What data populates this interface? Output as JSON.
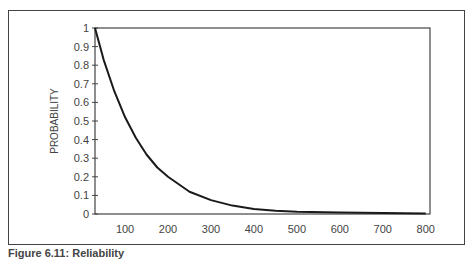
{
  "caption": "Figure 6.11: Reliability",
  "chart_data": {
    "type": "line",
    "title": "",
    "xlabel": "",
    "ylabel": "PROBABILITY",
    "xlim": [
      30,
      810
    ],
    "ylim": [
      0,
      1
    ],
    "x_ticks": [
      100,
      200,
      300,
      400,
      500,
      600,
      700,
      800
    ],
    "y_ticks": [
      0,
      0.1,
      0.2,
      0.3,
      0.4,
      0.5,
      0.6,
      0.7,
      0.8,
      0.9,
      1
    ],
    "y_tick_labels": [
      "0",
      "0.1",
      "0.2",
      "0.3",
      "0.4",
      "0.5",
      "0.6",
      "0.7",
      "0.8",
      "0.9",
      "1"
    ],
    "grid": false,
    "legend": null,
    "series": [
      {
        "name": "Reliability",
        "x": [
          30,
          50,
          75,
          100,
          125,
          150,
          175,
          200,
          250,
          300,
          350,
          400,
          450,
          500,
          600,
          700,
          800
        ],
        "values": [
          1.0,
          0.83,
          0.66,
          0.52,
          0.41,
          0.32,
          0.25,
          0.2,
          0.12,
          0.075,
          0.045,
          0.027,
          0.017,
          0.012,
          0.008,
          0.005,
          0.003
        ]
      }
    ]
  },
  "colors": {
    "line": "#1a1a1a",
    "axis": "#444444",
    "frame": "#444444"
  }
}
